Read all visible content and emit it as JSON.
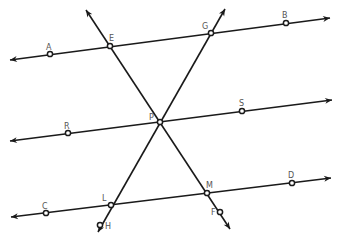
{
  "diagram": {
    "stroke_color": "#1a1a1a",
    "label_color": "#555555",
    "lines": [
      {
        "id": "line-ab",
        "name": "Line AB",
        "points": [
          "A",
          "E",
          "G",
          "B"
        ],
        "arrows": "both"
      },
      {
        "id": "line-rs",
        "name": "Line RS",
        "points": [
          "R",
          "P",
          "S"
        ],
        "arrows": "both"
      },
      {
        "id": "line-cd",
        "name": "Line CD",
        "points": [
          "C",
          "L",
          "M",
          "D"
        ],
        "arrows": "both"
      },
      {
        "id": "transversal-ef",
        "name": "Transversal EF",
        "points": [
          "E",
          "P",
          "M",
          "F"
        ],
        "arrows": "both"
      },
      {
        "id": "transversal-gh",
        "name": "Transversal GH",
        "points": [
          "G",
          "P",
          "L",
          "H"
        ],
        "arrows": "both"
      }
    ],
    "points": [
      {
        "label": "A"
      },
      {
        "label": "E"
      },
      {
        "label": "G"
      },
      {
        "label": "B"
      },
      {
        "label": "R"
      },
      {
        "label": "P"
      },
      {
        "label": "S"
      },
      {
        "label": "C"
      },
      {
        "label": "L"
      },
      {
        "label": "M"
      },
      {
        "label": "D"
      },
      {
        "label": "F"
      },
      {
        "label": "H"
      }
    ]
  }
}
